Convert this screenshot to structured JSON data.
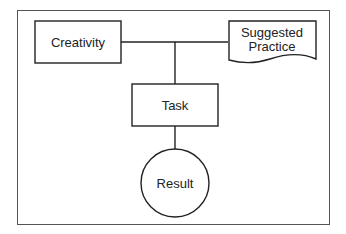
{
  "diagram": {
    "nodes": [
      {
        "id": "creativity",
        "label": "Creativity",
        "shape": "rectangle"
      },
      {
        "id": "suggested_practice",
        "label_lines": [
          "Suggested",
          "Practice"
        ],
        "shape": "document"
      },
      {
        "id": "task",
        "label": "Task",
        "shape": "rectangle"
      },
      {
        "id": "result",
        "label": "Result",
        "shape": "circle"
      }
    ],
    "edges": [
      {
        "from": "creativity",
        "to": "suggested_practice"
      },
      {
        "from": "creativity-practice-junction",
        "to": "task"
      },
      {
        "from": "task",
        "to": "result"
      }
    ]
  },
  "colors": {
    "stroke": "#333333",
    "frame": "#555555",
    "background": "#ffffff"
  }
}
